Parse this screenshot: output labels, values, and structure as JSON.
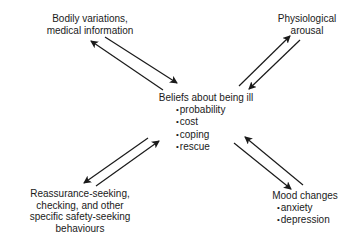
{
  "diagram": {
    "type": "cycle-interaction-model",
    "center": {
      "title": "Beliefs about being ill",
      "items": [
        "probability",
        "cost",
        "coping",
        "rescue"
      ]
    },
    "nodes": {
      "top_left": {
        "lines": [
          "Bodily variations,",
          "medical information"
        ]
      },
      "top_right": {
        "lines": [
          "Physiological",
          "arousal"
        ]
      },
      "bottom_left": {
        "lines": [
          "Reassurance-seeking,",
          "checking, and other",
          "specific safety-seeking",
          "behaviours"
        ]
      },
      "bottom_right": {
        "title": "Mood changes",
        "items": [
          "anxiety",
          "depression"
        ]
      }
    },
    "edges": [
      {
        "from": "top_left",
        "to": "center",
        "bidirectional": true
      },
      {
        "from": "top_right",
        "to": "center",
        "bidirectional": true
      },
      {
        "from": "bottom_left",
        "to": "center",
        "bidirectional": true
      },
      {
        "from": "bottom_right",
        "to": "center",
        "bidirectional": true
      }
    ],
    "colors": {
      "background": "#ffffff",
      "ink": "#1a1a1a"
    }
  }
}
